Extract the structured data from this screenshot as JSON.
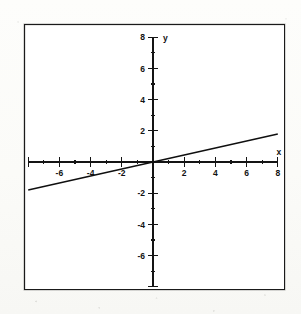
{
  "chart_data": {
    "type": "line",
    "title": "",
    "xlabel": "x",
    "ylabel": "y",
    "xlim": [
      -8,
      8
    ],
    "ylim": [
      -8,
      8
    ],
    "grid": false,
    "legend": "none",
    "x_major_ticks": [
      -8,
      -6,
      -4,
      -2,
      2,
      4,
      6,
      8
    ],
    "y_major_ticks": [
      -8,
      -6,
      -4,
      -2,
      2,
      4,
      6,
      8
    ],
    "x_tick_labels": [
      "-6",
      "-4",
      "-2",
      "2",
      "4",
      "6",
      "8"
    ],
    "y_tick_labels": [
      "8",
      "6",
      "4",
      "2",
      "-2",
      "-4",
      "-6"
    ],
    "minor_tick_interval": 1,
    "series": [
      {
        "name": "line",
        "slope": 0.22,
        "intercept": 0,
        "x": [
          -8,
          8
        ],
        "values": [
          -1.8,
          1.8
        ]
      }
    ]
  },
  "axis_labels": {
    "x": "x",
    "y": "y",
    "x_ticks": [
      {
        "value": -6,
        "label": "-6"
      },
      {
        "value": -4,
        "label": "-4"
      },
      {
        "value": -2,
        "label": "-2"
      },
      {
        "value": 2,
        "label": "2"
      },
      {
        "value": 4,
        "label": "4"
      },
      {
        "value": 6,
        "label": "6"
      },
      {
        "value": 8,
        "label": "8"
      }
    ],
    "y_ticks": [
      {
        "value": 8,
        "label": "8"
      },
      {
        "value": 6,
        "label": "6"
      },
      {
        "value": 4,
        "label": "4"
      },
      {
        "value": 2,
        "label": "2"
      },
      {
        "value": -2,
        "label": "-2"
      },
      {
        "value": -4,
        "label": "-4"
      },
      {
        "value": -6,
        "label": "-6"
      }
    ]
  },
  "colors": {
    "ink": "#141414",
    "paper": "#ffffff",
    "page_background": "#fcfcfa"
  }
}
